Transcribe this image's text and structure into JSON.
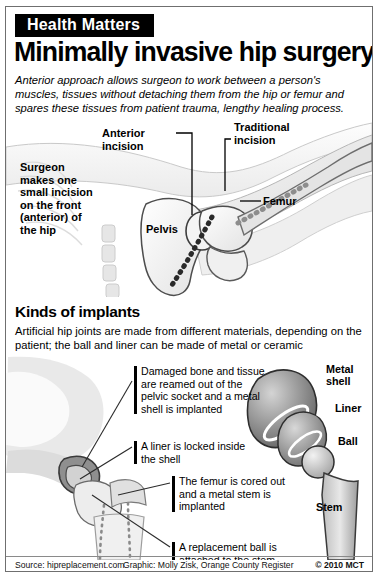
{
  "header": {
    "kicker": "Health Matters",
    "headline": "Minimally invasive hip surgery",
    "deck": "Anterior approach allows surgeon to work between a person's muscles, tissues without detaching them from the hip or femur and spares these tissues from patient trauma, lengthy healing process."
  },
  "top_figure": {
    "labels": {
      "surgeon": "Surgeon makes one small incision on the front (anterior) of the hip",
      "anterior_incision": "Anterior incision",
      "traditional_incision": "Traditional incision",
      "femur": "Femur",
      "pelvis": "Pelvis"
    }
  },
  "implants_section": {
    "title": "Kinds of implants",
    "body": "Artificial hip joints are made from different materials, depending on the patient; the ball and liner can be made of metal or ceramic"
  },
  "bottom_figure": {
    "callouts": [
      "Damaged bone and tissue are reamed out of the pelvic socket and a metal shell is implanted",
      "A liner is locked inside the shell",
      "The femur is cored out and a metal stem is implanted",
      "A replacement ball is attached to the stem"
    ],
    "part_labels": {
      "metal_shell": "Metal shell",
      "liner": "Liner",
      "ball": "Ball",
      "stem": "Stem"
    }
  },
  "footer": {
    "source": "Source: hipreplacement.com",
    "graphic": "Graphic: Molly Zisk, Orange County Register",
    "copyright": "© 2010 MCT"
  },
  "colors": {
    "ink": "#000000",
    "border": "#6f6f6f",
    "bone_light": "#f2f2f2",
    "bone_mid": "#d9d9d9",
    "bone_dark": "#9a9a9a",
    "metal_dark": "#6e6e6e",
    "metal_light": "#e8e8e8"
  }
}
